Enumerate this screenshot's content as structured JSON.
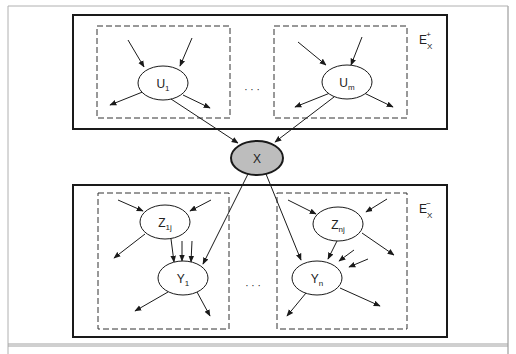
{
  "diagram": {
    "type": "bayesian-network-evidence-partition",
    "center_node": {
      "label": "X",
      "fill": "#bdbdbd"
    },
    "top_region": {
      "label": "E",
      "label_sub": "X",
      "label_sup": "+",
      "parents": [
        {
          "base": "U",
          "sub": "1"
        },
        {
          "base": "U",
          "sub": "m"
        }
      ],
      "ellipsis": "· · ·"
    },
    "bottom_region": {
      "label": "E",
      "label_sub": "X",
      "label_sup": "−",
      "groups": [
        {
          "child": {
            "base": "Y",
            "sub": "1"
          },
          "coparent": {
            "base": "Z",
            "sub": "1j"
          }
        },
        {
          "child": {
            "base": "Y",
            "sub": "n"
          },
          "coparent": {
            "base": "Z",
            "sub": "nj"
          }
        }
      ],
      "ellipsis": "· · ·"
    },
    "colors": {
      "stroke": "#1a1a1a",
      "frame": "#9a9a9a",
      "node_fill": "#ffffff",
      "center_fill": "#bdbdbd"
    }
  }
}
